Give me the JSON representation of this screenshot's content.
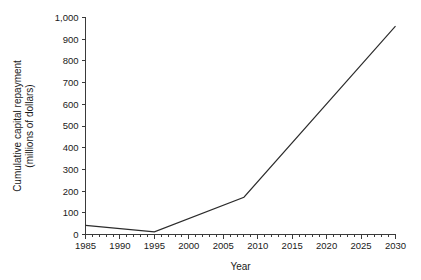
{
  "chart_data": {
    "type": "line",
    "title": "",
    "xlabel": "Year",
    "ylabel": "Cumulative capital repayment (millions of dollars)",
    "ylabel_line1": "Cumulative capital repayment",
    "ylabel_line2": "(millions of dollars)",
    "xlim": [
      1985,
      2030
    ],
    "ylim": [
      0,
      1000
    ],
    "grid": false,
    "legend": null,
    "x_ticks": [
      1985,
      1990,
      1995,
      2000,
      2005,
      2010,
      2015,
      2020,
      2025,
      2030
    ],
    "x_tick_labels": [
      "1985",
      "1990",
      "1995",
      "2000",
      "2005",
      "2010",
      "2015",
      "2020",
      "2025",
      "2030"
    ],
    "x_minor_tick_step": 1,
    "y_ticks": [
      0,
      100,
      200,
      300,
      400,
      500,
      600,
      700,
      800,
      900,
      1000
    ],
    "y_tick_labels": [
      "0",
      "100",
      "200",
      "300",
      "400",
      "500",
      "600",
      "700",
      "800",
      "900",
      "1,000"
    ],
    "series": [
      {
        "name": "Cumulative capital repayment",
        "color": "#2b2b2b",
        "x": [
          1985,
          1995,
          2008,
          2030
        ],
        "values": [
          42,
          12,
          172,
          960
        ]
      }
    ]
  }
}
